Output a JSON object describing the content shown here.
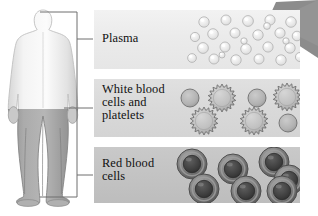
{
  "diagram": {
    "background_color": "#ffffff"
  },
  "figure": {
    "name": "human-body-silhouette",
    "upper_body_color": "#ededed",
    "lower_body_color": "#9a9a9a",
    "outline_color": "#b9b9b9"
  },
  "bracket": {
    "name": "callout-bracket",
    "color": "#6e6e6e"
  },
  "wedge": {
    "name": "magnifier-cone",
    "color": "#8c8c8c"
  },
  "panels": [
    {
      "id": "plasma",
      "label": "Plasma",
      "background_color": "#ebebeb",
      "cell_type": "plasma-droplet",
      "cell_fill": "#e4e4e4",
      "cell_stroke": "#b0b0b0",
      "cell_count": 26,
      "cells": [
        {
          "cx": 110,
          "cy": 12,
          "r": 5.2
        },
        {
          "cx": 132,
          "cy": 10,
          "r": 5.0
        },
        {
          "cx": 154,
          "cy": 11,
          "r": 5.4
        },
        {
          "cx": 176,
          "cy": 10,
          "r": 5.1
        },
        {
          "cx": 197,
          "cy": 12,
          "r": 5.3
        },
        {
          "cx": 119,
          "cy": 24,
          "r": 5.3
        },
        {
          "cx": 141,
          "cy": 23,
          "r": 5.0
        },
        {
          "cx": 164,
          "cy": 25,
          "r": 5.2
        },
        {
          "cx": 186,
          "cy": 23,
          "r": 5.1
        },
        {
          "cx": 101,
          "cy": 27,
          "r": 4.6
        },
        {
          "cx": 109,
          "cy": 38,
          "r": 5.4
        },
        {
          "cx": 131,
          "cy": 37,
          "r": 5.0
        },
        {
          "cx": 152,
          "cy": 39,
          "r": 5.3
        },
        {
          "cx": 174,
          "cy": 37,
          "r": 5.1
        },
        {
          "cx": 196,
          "cy": 38,
          "r": 5.2
        },
        {
          "cx": 120,
          "cy": 49,
          "r": 5.0
        },
        {
          "cx": 142,
          "cy": 50,
          "r": 5.2
        },
        {
          "cx": 165,
          "cy": 49,
          "r": 5.0
        },
        {
          "cx": 187,
          "cy": 50,
          "r": 5.2
        },
        {
          "cx": 203,
          "cy": 26,
          "r": 4.8
        },
        {
          "cx": 98,
          "cy": 48,
          "r": 4.4
        },
        {
          "cx": 206,
          "cy": 47,
          "r": 4.6
        },
        {
          "cx": 173,
          "cy": 16,
          "r": 3.4
        },
        {
          "cx": 150,
          "cy": 31,
          "r": 3.2
        },
        {
          "cx": 128,
          "cy": 45,
          "r": 3.0
        },
        {
          "cx": 192,
          "cy": 31,
          "r": 3.2
        }
      ]
    },
    {
      "id": "wbc",
      "label": "White blood\ncells and\nplatelets",
      "background_color": "#d9d9d9",
      "cell_type": "spiky-leukocyte",
      "wbc_fill": "#bdbdbd",
      "wbc_stroke": "#6f6f6f",
      "platelet_fill": "#b4b4b4",
      "platelet_stroke": "#6f6f6f",
      "cells": [
        {
          "kind": "platelet",
          "cx": 96,
          "cy": 19,
          "r": 9
        },
        {
          "kind": "wbc",
          "cx": 128,
          "cy": 19,
          "r": 14,
          "spikes": 18
        },
        {
          "kind": "platelet",
          "cx": 163,
          "cy": 19,
          "r": 9
        },
        {
          "kind": "wbc",
          "cx": 193,
          "cy": 18,
          "r": 14,
          "spikes": 18
        },
        {
          "kind": "wbc",
          "cx": 110,
          "cy": 42,
          "r": 14,
          "spikes": 18
        },
        {
          "kind": "wbc",
          "cx": 160,
          "cy": 42,
          "r": 14,
          "spikes": 18
        },
        {
          "kind": "platelet",
          "cx": 194,
          "cy": 44,
          "r": 9
        }
      ]
    },
    {
      "id": "rbc",
      "label": "Red blood\ncells",
      "background_color": "#c3c3c3",
      "cell_type": "erythrocyte-torus",
      "rim_color": "#6a6a6a",
      "mid_color": "#8a8a8a",
      "core_color": "#3c3c3c",
      "cells": [
        {
          "cx": 98,
          "cy": 17,
          "r": 15
        },
        {
          "cx": 139,
          "cy": 22,
          "r": 15
        },
        {
          "cx": 180,
          "cy": 15,
          "r": 15
        },
        {
          "cx": 195,
          "cy": 33,
          "r": 15
        },
        {
          "cx": 110,
          "cy": 42,
          "r": 15
        },
        {
          "cx": 152,
          "cy": 44,
          "r": 15
        },
        {
          "cx": 188,
          "cy": 44,
          "r": 15
        }
      ]
    }
  ]
}
